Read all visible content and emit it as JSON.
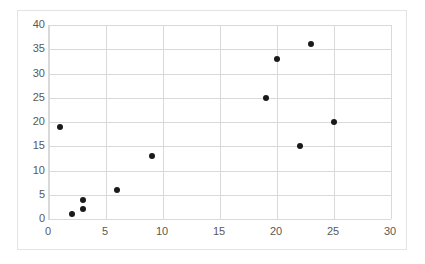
{
  "chart_data": {
    "type": "scatter",
    "title": "",
    "xlabel": "",
    "ylabel": "",
    "xlim": [
      0,
      30
    ],
    "ylim": [
      0,
      40
    ],
    "xticks": [
      0,
      5,
      10,
      15,
      20,
      25,
      30
    ],
    "yticks": [
      0,
      5,
      10,
      15,
      20,
      25,
      30,
      35,
      40
    ],
    "grid": true,
    "legend": "none",
    "series": [
      {
        "name": "series-1",
        "marker": "circle",
        "color": "#1a1a1a",
        "points": [
          {
            "x": 1,
            "y": 19
          },
          {
            "x": 2,
            "y": 1
          },
          {
            "x": 3,
            "y": 2
          },
          {
            "x": 3,
            "y": 4
          },
          {
            "x": 6,
            "y": 6
          },
          {
            "x": 9,
            "y": 13
          },
          {
            "x": 19,
            "y": 25
          },
          {
            "x": 20,
            "y": 33
          },
          {
            "x": 22,
            "y": 15
          },
          {
            "x": 23,
            "y": 36
          },
          {
            "x": 25,
            "y": 20
          }
        ]
      }
    ]
  },
  "style": {
    "grid_color": "#d9d9d9",
    "frame_color": "#e3e3e3",
    "tick_label_color": "#595959",
    "plot_background": "#ffffff",
    "marker_color": "#1a1a1a"
  }
}
